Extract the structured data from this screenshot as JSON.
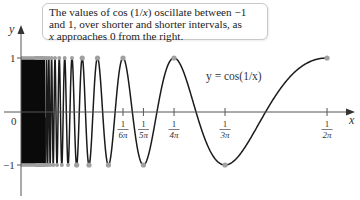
{
  "callout": {
    "line1": "The values of cos (1/x) oscillate between −1",
    "line2": "and 1, over shorter and shorter intervals, as",
    "line3": "x approaches 0 from the right."
  },
  "curve_label": "y = cos(1/x)",
  "axes": {
    "x_label": "x",
    "y_label": "y",
    "origin_label": "0",
    "y_ticks": [
      "1",
      "−1"
    ]
  },
  "x_ticks": [
    {
      "num": "1",
      "den": "6π",
      "value": 0.05305
    },
    {
      "num": "1",
      "den": "5π",
      "value": 0.06366
    },
    {
      "num": "1",
      "den": "4π",
      "value": 0.07958
    },
    {
      "num": "1",
      "den": "3π",
      "value": 0.1061
    },
    {
      "num": "1",
      "den": "2π",
      "value": 0.15915
    }
  ],
  "colors": {
    "curve": "#1a1a1a",
    "axis": "#555555",
    "extrema_points": "#a0a0a0",
    "callout_border": "#c9c9c9"
  },
  "chart_data": {
    "type": "line",
    "title": "",
    "function": "y = cos(1/x)",
    "xlabel": "x",
    "ylabel": "y",
    "xlim": [
      0,
      0.17
    ],
    "ylim": [
      -1,
      1
    ],
    "grid": false,
    "legend": null,
    "annotations": [
      "The values of cos (1/x) oscillate between −1 and 1, over shorter and shorter intervals, as x approaches 0 from the right.",
      "y = cos(1/x)"
    ],
    "x_tick_labels": [
      "1/(6π)",
      "1/(5π)",
      "1/(4π)",
      "1/(3π)",
      "1/(2π)"
    ],
    "y_tick_labels": [
      "1",
      "−1"
    ],
    "highlighted_points": {
      "maxima": [
        {
          "x": "1/(2π)",
          "y": 1
        },
        {
          "x": "1/(4π)",
          "y": 1
        },
        {
          "x": "1/(6π)",
          "y": 1
        }
      ],
      "minima": [
        {
          "x": "1/(3π)",
          "y": -1
        },
        {
          "x": "1/(5π)",
          "y": -1
        }
      ]
    },
    "x": [
      0.159155,
      0.1061,
      0.079577,
      0.063662,
      0.053052,
      0.045473,
      0.039789
    ],
    "y": [
      1,
      -1,
      1,
      -1,
      1,
      -1,
      1
    ]
  }
}
